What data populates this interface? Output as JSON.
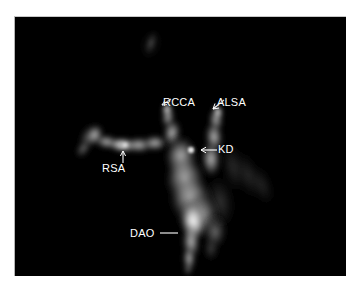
{
  "figure": {
    "modality": "mr-angiography",
    "panel_background": "#000000",
    "page_background": "#ffffff",
    "annotation_color": "#ffffff"
  },
  "annotations": [
    {
      "id": "rcca",
      "label": "RCCA",
      "leader": "diagonal-down-left",
      "name": "annotation-rcca"
    },
    {
      "id": "alsa",
      "label": "ALSA",
      "leader": "diagonal-down-left",
      "name": "annotation-alsa"
    },
    {
      "id": "kd",
      "label": "KD",
      "leader": "arrow-left",
      "name": "annotation-kd"
    },
    {
      "id": "rsa",
      "label": "RSA",
      "leader": "arrow-up",
      "name": "annotation-rsa"
    },
    {
      "id": "dao",
      "label": "DAO",
      "leader": "line-right",
      "name": "annotation-dao"
    }
  ],
  "labels": {
    "rcca": "RCCA",
    "alsa": "ALSA",
    "kd": "KD",
    "rsa": "RSA",
    "dao": "DAO"
  }
}
